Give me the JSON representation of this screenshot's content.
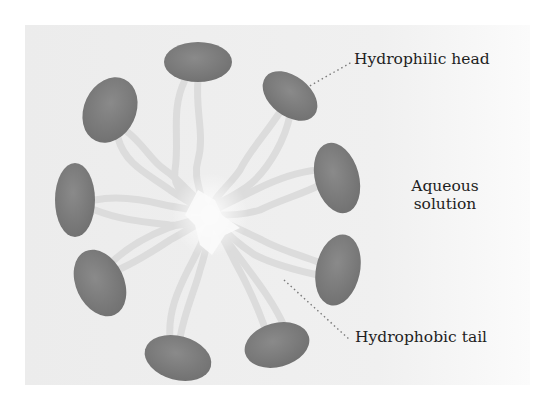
{
  "diagram": {
    "labels": {
      "hydrophilic_head": "Hydrophilic head",
      "hydrophobic_tail": "Hydrophobic tail",
      "aqueous_line1": "Aqueous",
      "aqueous_line2": "solution"
    },
    "colors": {
      "background_panel": "#efefef",
      "head_fill": "#7a7a7a",
      "tail_stroke": "#dcdcdc",
      "core": "#fafafa",
      "leader_line": "#7a7a7a",
      "text": "#1e1e1e"
    },
    "heads": [
      {
        "cx": 198,
        "cy": 62,
        "rx": 34,
        "ry": 20,
        "rot": 0
      },
      {
        "cx": 290,
        "cy": 96,
        "rx": 31,
        "ry": 20,
        "rot": 38
      },
      {
        "cx": 110,
        "cy": 110,
        "rx": 26,
        "ry": 34,
        "rot": 25
      },
      {
        "cx": 337,
        "cy": 178,
        "rx": 22,
        "ry": 36,
        "rot": -15
      },
      {
        "cx": 75,
        "cy": 200,
        "rx": 20,
        "ry": 37,
        "rot": 0
      },
      {
        "cx": 338,
        "cy": 270,
        "rx": 22,
        "ry": 36,
        "rot": 12
      },
      {
        "cx": 100,
        "cy": 283,
        "rx": 24,
        "ry": 35,
        "rot": -25
      },
      {
        "cx": 277,
        "cy": 345,
        "rx": 33,
        "ry": 22,
        "rot": -15
      },
      {
        "cx": 178,
        "cy": 358,
        "rx": 34,
        "ry": 22,
        "rot": 15
      }
    ]
  }
}
